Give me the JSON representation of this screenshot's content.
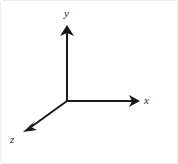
{
  "figure": {
    "canvas": {
      "width": 178,
      "height": 164,
      "background": "#ffffff"
    },
    "border_color": "#ededed",
    "stroke_color": "#1a1a1a",
    "stroke_width": 2,
    "label_color": "#2b2b2b"
  },
  "origin": {
    "x": 67,
    "y": 101
  },
  "axes": [
    {
      "id": "y",
      "label": "y",
      "direction": "up",
      "from": {
        "x": 67,
        "y": 101
      },
      "to": {
        "x": 67,
        "y": 26
      },
      "arrowhead": "filled-triangle",
      "label_position": {
        "x": 68,
        "y": 13
      }
    },
    {
      "id": "x",
      "label": "x",
      "direction": "right",
      "from": {
        "x": 67,
        "y": 101
      },
      "to": {
        "x": 140,
        "y": 101
      },
      "arrowhead": "filled-triangle",
      "label_position": {
        "x": 147,
        "y": 101
      }
    },
    {
      "id": "z",
      "label": "z",
      "direction": "down-left",
      "from": {
        "x": 67,
        "y": 101
      },
      "to": {
        "x": 24,
        "y": 132
      },
      "arrowhead": "filled-triangle",
      "label_position": {
        "x": 15,
        "y": 140
      }
    }
  ]
}
